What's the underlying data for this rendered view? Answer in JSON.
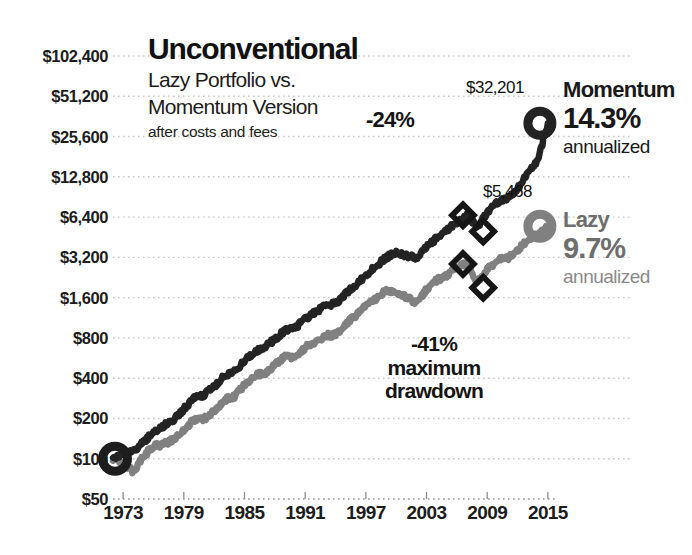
{
  "title": {
    "main": "Unconventional",
    "subtitle_line1": "Lazy Portfolio vs.",
    "subtitle_line2": "Momentum Version",
    "note": "after costs and fees"
  },
  "legend": {
    "momentum": {
      "name": "Momentum",
      "pct": "14.3%",
      "sub": "annualized",
      "end_value_label": "$32,201",
      "color": "#232323"
    },
    "lazy": {
      "name": "Lazy",
      "pct": "9.7%",
      "sub": "annualized",
      "end_value_label": "$5,468",
      "color": "#808080"
    }
  },
  "annotations": {
    "momentum_drawdown": "-24%",
    "lazy_drawdown_pct": "-41%",
    "lazy_drawdown_line2": "maximum",
    "lazy_drawdown_line3": "drawdown"
  },
  "chart_data": {
    "type": "line",
    "title": "Unconventional",
    "subtitle": "Lazy Portfolio vs. Momentum Version after costs and fees",
    "xlabel": "",
    "ylabel": "",
    "yscale": "log",
    "ylim": [
      50,
      102400
    ],
    "xlim": [
      1972,
      2016
    ],
    "grid": true,
    "legend_position": "right",
    "yticks": [
      50,
      100,
      200,
      400,
      800,
      1600,
      3200,
      6400,
      12800,
      25600,
      51200,
      102400
    ],
    "ytick_labels": [
      "$50",
      "$100",
      "$200",
      "$400",
      "$800",
      "$1,600",
      "$3,200",
      "$6,400",
      "$12,800",
      "$25,600",
      "$51,200",
      "$102,400"
    ],
    "xticks": [
      1973,
      1979,
      1985,
      1991,
      1997,
      2003,
      2009,
      2015
    ],
    "xtick_labels": [
      "1973",
      "1979",
      "1985",
      "1991",
      "1997",
      "2003",
      "2009",
      "2015"
    ],
    "series": [
      {
        "name": "Momentum",
        "color": "#232323",
        "annualized_return": "14.3%",
        "start_value": 100,
        "end_value": 32201,
        "max_drawdown": "-24%",
        "x": [
          1972,
          1973,
          1974,
          1975,
          1976,
          1977,
          1978,
          1979,
          1980,
          1981,
          1982,
          1983,
          1984,
          1985,
          1986,
          1987,
          1988,
          1989,
          1990,
          1991,
          1992,
          1993,
          1994,
          1995,
          1996,
          1997,
          1998,
          1999,
          2000,
          2001,
          2002,
          2003,
          2004,
          2005,
          2006,
          2007,
          2008,
          2009,
          2010,
          2011,
          2012,
          2013,
          2014,
          2015
        ],
        "values": [
          100,
          108,
          112,
          133,
          158,
          176,
          196,
          235,
          282,
          300,
          345,
          414,
          447,
          536,
          634,
          690,
          780,
          910,
          940,
          1120,
          1240,
          1420,
          1440,
          1720,
          2000,
          2350,
          2750,
          3200,
          3450,
          3300,
          3150,
          3800,
          4450,
          5050,
          5900,
          6600,
          5400,
          6900,
          8300,
          8900,
          10400,
          13600,
          16800,
          32201
        ]
      },
      {
        "name": "Lazy",
        "color": "#808080",
        "annualized_return": "9.7%",
        "start_value": 100,
        "end_value": 5468,
        "max_drawdown": "-41%",
        "x": [
          1972,
          1973,
          1974,
          1975,
          1976,
          1977,
          1978,
          1979,
          1980,
          1981,
          1982,
          1983,
          1984,
          1985,
          1986,
          1987,
          1988,
          1989,
          1990,
          1991,
          1992,
          1993,
          1994,
          1995,
          1996,
          1997,
          1998,
          1999,
          2000,
          2001,
          2002,
          2003,
          2004,
          2005,
          2006,
          2007,
          2008,
          2009,
          2010,
          2011,
          2012,
          2013,
          2014,
          2015
        ],
        "values": [
          100,
          92,
          80,
          104,
          124,
          128,
          140,
          165,
          196,
          198,
          226,
          276,
          290,
          356,
          420,
          436,
          500,
          580,
          560,
          680,
          740,
          840,
          840,
          1010,
          1180,
          1380,
          1560,
          1800,
          1780,
          1620,
          1450,
          1850,
          2150,
          2350,
          2700,
          2850,
          2050,
          2600,
          3050,
          3150,
          3600,
          4300,
          4750,
          5468
        ]
      }
    ],
    "markers": {
      "start_rings": [
        {
          "series": "both",
          "x": 1972,
          "value": 100
        }
      ],
      "end_rings": [
        {
          "series": "Momentum",
          "x": 2015,
          "value": 32201,
          "label": "$32,201"
        },
        {
          "series": "Lazy",
          "x": 2015,
          "value": 5468,
          "label": "$5,468"
        }
      ],
      "drawdown_diamonds": [
        {
          "series": "Momentum",
          "x": 2007,
          "value": 6600
        },
        {
          "series": "Momentum",
          "x": 2009,
          "value": 5000
        },
        {
          "series": "Lazy",
          "x": 2007,
          "value": 2850
        },
        {
          "series": "Lazy",
          "x": 2009,
          "value": 1900
        }
      ]
    }
  }
}
